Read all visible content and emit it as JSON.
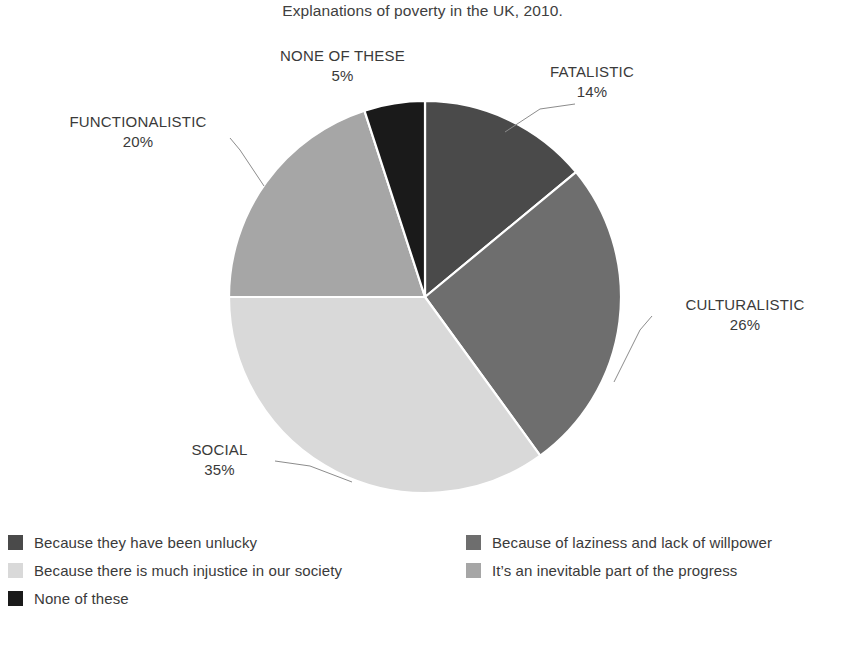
{
  "chart": {
    "title": "Explanations of poverty in the UK, 2010."
  },
  "chart_data": {
    "type": "pie",
    "title": "Explanations of poverty in the UK, 2010.",
    "xlabel": "",
    "ylabel": "",
    "categories": [
      "FATALISTIC",
      "CULTURALISTIC",
      "SOCIAL",
      "FUNCTIONALISTIC",
      "NONE OF THESE"
    ],
    "values": [
      14,
      26,
      35,
      20,
      5
    ],
    "value_unit": "percent",
    "value_labels": [
      "14%",
      "26%",
      "35%",
      "20%",
      "5%"
    ],
    "colors": [
      "#4a4a4a",
      "#6e6e6e",
      "#d9d9d9",
      "#a6a6a6",
      "#1a1a1a"
    ],
    "start_angle_deg": 0,
    "direction": "clockwise",
    "labels_position": "outside-with-leader-lines",
    "legend_position": "bottom",
    "grid": false,
    "slices": [
      {
        "category": "FATALISTIC",
        "value": 14,
        "value_label": "14%",
        "color": "#4a4a4a",
        "legend_label": "Because they have been unlucky"
      },
      {
        "category": "CULTURALISTIC",
        "value": 26,
        "value_label": "26%",
        "color": "#6e6e6e",
        "legend_label": "Because of laziness and lack of willpower"
      },
      {
        "category": "SOCIAL",
        "value": 35,
        "value_label": "35%",
        "color": "#d9d9d9",
        "legend_label": "Because there is much injustice in our society"
      },
      {
        "category": "FUNCTIONALISTIC",
        "value": 20,
        "value_label": "20%",
        "color": "#a6a6a6",
        "legend_label": "It’s an inevitable part of the progress"
      },
      {
        "category": "NONE OF THESE",
        "value": 5,
        "value_label": "5%",
        "color": "#1a1a1a",
        "legend_label": "None of these"
      }
    ],
    "legend": [
      {
        "label": "Because they have been unlucky",
        "color": "#4a4a4a",
        "column": "left"
      },
      {
        "label": "Because of laziness and lack of willpower",
        "color": "#6e6e6e",
        "column": "right"
      },
      {
        "label": "Because there is much injustice in our society",
        "color": "#d9d9d9",
        "column": "left"
      },
      {
        "label": "It’s an inevitable part of the progress",
        "color": "#a6a6a6",
        "column": "right"
      },
      {
        "label": "None of these",
        "color": "#1a1a1a",
        "column": "left"
      }
    ]
  }
}
